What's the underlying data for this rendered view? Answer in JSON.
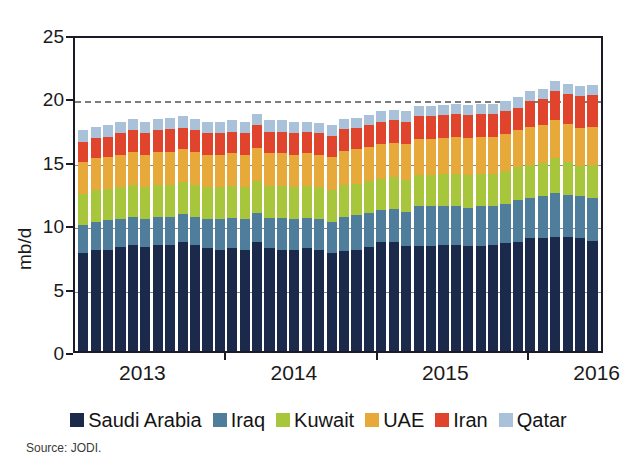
{
  "chart_data": {
    "type": "bar",
    "stacked": true,
    "title": "",
    "subtitle": "",
    "xlabel": "",
    "ylabel": "mb/d",
    "ylim": [
      0,
      25
    ],
    "yticks": [
      0,
      5,
      10,
      15,
      20,
      25
    ],
    "grid": true,
    "gridlines_at": [
      5,
      10,
      15
    ],
    "reference_line": {
      "value": 20,
      "style": "dashed",
      "color": "#7d7d7d"
    },
    "legend_position": "bottom",
    "source": "Source: JODI.",
    "xticks": [
      "2013",
      "2014",
      "2015",
      "2016"
    ],
    "x": [
      "Jan 2013",
      "Feb 2013",
      "Mar 2013",
      "Apr 2013",
      "May 2013",
      "Jun 2013",
      "Jul 2013",
      "Aug 2013",
      "Sep 2013",
      "Oct 2013",
      "Nov 2013",
      "Dec 2013",
      "Jan 2014",
      "Feb 2014",
      "Mar 2014",
      "Apr 2014",
      "May 2014",
      "Jun 2014",
      "Jul 2014",
      "Aug 2014",
      "Sep 2014",
      "Oct 2014",
      "Nov 2014",
      "Dec 2014",
      "Jan 2015",
      "Feb 2015",
      "Mar 2015",
      "Apr 2015",
      "May 2015",
      "Jun 2015",
      "Jul 2015",
      "Aug 2015",
      "Sep 2015",
      "Oct 2015",
      "Nov 2015",
      "Dec 2015",
      "Jan 2016",
      "Feb 2016",
      "Mar 2016",
      "Apr 2016",
      "May 2016",
      "Jun 2016"
    ],
    "series": [
      {
        "name": "Saudi Arabia",
        "color": "#1b2a4a",
        "values": [
          7.7,
          8.0,
          8.0,
          8.2,
          8.4,
          8.2,
          8.4,
          8.4,
          8.6,
          8.4,
          8.1,
          8.0,
          8.1,
          8.0,
          8.6,
          8.1,
          8.0,
          8.0,
          8.1,
          8.0,
          7.7,
          7.9,
          8.0,
          8.2,
          8.6,
          8.6,
          8.3,
          8.3,
          8.3,
          8.4,
          8.4,
          8.3,
          8.3,
          8.4,
          8.5,
          8.6,
          8.9,
          8.9,
          9.0,
          9.0,
          8.9,
          8.7
        ]
      },
      {
        "name": "Iraq",
        "color": "#4f7d9c",
        "values": [
          2.2,
          2.2,
          2.3,
          2.2,
          2.2,
          2.2,
          2.2,
          2.2,
          2.2,
          2.2,
          2.3,
          2.4,
          2.4,
          2.4,
          2.3,
          2.4,
          2.5,
          2.4,
          2.4,
          2.4,
          2.5,
          2.7,
          2.7,
          2.7,
          2.5,
          2.6,
          2.7,
          3.1,
          3.1,
          3.0,
          3.0,
          3.0,
          3.1,
          3.0,
          3.1,
          3.3,
          3.2,
          3.3,
          3.5,
          3.3,
          3.3,
          3.4
        ]
      },
      {
        "name": "Kuwait",
        "color": "#a7c63c",
        "values": [
          2.5,
          2.5,
          2.5,
          2.5,
          2.5,
          2.5,
          2.5,
          2.5,
          2.5,
          2.5,
          2.5,
          2.5,
          2.5,
          2.5,
          2.5,
          2.5,
          2.5,
          2.5,
          2.5,
          2.5,
          2.5,
          2.5,
          2.5,
          2.5,
          2.5,
          2.5,
          2.5,
          2.5,
          2.5,
          2.6,
          2.6,
          2.6,
          2.6,
          2.6,
          2.6,
          2.6,
          2.6,
          2.6,
          2.7,
          2.6,
          2.4,
          2.6
        ]
      },
      {
        "name": "UAE",
        "color": "#e8a93b",
        "values": [
          2.5,
          2.5,
          2.5,
          2.6,
          2.6,
          2.6,
          2.6,
          2.6,
          2.6,
          2.6,
          2.6,
          2.6,
          2.6,
          2.6,
          2.6,
          2.6,
          2.6,
          2.6,
          2.6,
          2.6,
          2.6,
          2.7,
          2.7,
          2.7,
          2.7,
          2.7,
          2.8,
          2.8,
          2.8,
          2.8,
          2.9,
          2.9,
          2.9,
          2.9,
          2.9,
          2.9,
          3.0,
          3.0,
          3.0,
          3.0,
          3.0,
          3.0
        ]
      },
      {
        "name": "Iran",
        "color": "#e0442c",
        "values": [
          1.6,
          1.6,
          1.6,
          1.7,
          1.7,
          1.7,
          1.7,
          1.8,
          1.7,
          1.7,
          1.7,
          1.7,
          1.7,
          1.7,
          1.8,
          1.7,
          1.7,
          1.7,
          1.7,
          1.7,
          1.7,
          1.7,
          1.7,
          1.7,
          1.8,
          1.8,
          1.8,
          1.8,
          1.8,
          1.8,
          1.8,
          1.8,
          1.8,
          1.8,
          1.8,
          1.8,
          2.0,
          2.1,
          2.3,
          2.4,
          2.5,
          2.5
        ]
      },
      {
        "name": "Qatar",
        "color": "#a9c2da",
        "values": [
          0.9,
          0.9,
          0.9,
          0.9,
          0.9,
          0.9,
          0.9,
          0.9,
          0.9,
          0.9,
          0.9,
          0.9,
          0.9,
          0.9,
          0.9,
          0.9,
          0.9,
          0.9,
          0.8,
          0.8,
          0.8,
          0.8,
          0.8,
          0.8,
          0.8,
          0.8,
          0.8,
          0.8,
          0.8,
          0.8,
          0.8,
          0.8,
          0.8,
          0.8,
          0.8,
          0.8,
          0.8,
          0.8,
          0.8,
          0.8,
          0.8,
          0.8
        ]
      }
    ],
    "totals": [
      17.4,
      17.7,
      17.8,
      18.1,
      18.3,
      18.1,
      18.3,
      18.4,
      18.5,
      18.3,
      18.1,
      18.1,
      18.2,
      18.1,
      18.7,
      18.2,
      18.2,
      18.1,
      18.1,
      18.0,
      17.8,
      18.3,
      18.4,
      18.6,
      18.9,
      19.0,
      18.9,
      19.3,
      19.3,
      19.4,
      19.5,
      19.4,
      19.5,
      19.5,
      19.7,
      20.0,
      20.5,
      20.7,
      21.3,
      21.1,
      20.9,
      21.0
    ]
  },
  "legend": {
    "items": [
      {
        "label": "Saudi Arabia",
        "color": "#1b2a4a"
      },
      {
        "label": "Iraq",
        "color": "#4f7d9c"
      },
      {
        "label": "Kuwait",
        "color": "#a7c63c"
      },
      {
        "label": "UAE",
        "color": "#e8a93b"
      },
      {
        "label": "Iran",
        "color": "#e0442c"
      },
      {
        "label": "Qatar",
        "color": "#a9c2da"
      }
    ]
  },
  "axes": {
    "y_label": "mb/d",
    "y_ticks": [
      "0",
      "5",
      "10",
      "15",
      "20",
      "25"
    ],
    "x_ticks": [
      "2013",
      "2014",
      "2015",
      "2016"
    ]
  },
  "footer": {
    "source": "Source: JODI."
  }
}
